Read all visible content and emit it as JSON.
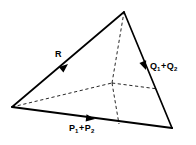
{
  "figure": {
    "name": "tetrahedron-force-diagram",
    "background_color": "#ffffff",
    "line_color": "#000000",
    "width": 196,
    "height": 145,
    "labels": {
      "resultant": {
        "text": "R",
        "base": "R",
        "sub1": "",
        "plus": "",
        "base2": "",
        "sub2": ""
      },
      "right_edge": {
        "text": "Q1 + Q2",
        "base": "Q",
        "sub1": "1",
        "plus": "+",
        "base2": "Q",
        "sub2": "2"
      },
      "bottom_edge": {
        "text": "P1 + P2",
        "base": "P",
        "sub1": "1",
        "plus": "+",
        "base2": "P",
        "sub2": "2"
      }
    },
    "vertices": {
      "apex": {
        "x": 124,
        "y": 12
      },
      "left": {
        "x": 12,
        "y": 107
      },
      "bottom_right": {
        "x": 172,
        "y": 128
      },
      "rear_hidden": {
        "x": 112,
        "y": 83
      }
    },
    "edge_points": {
      "right_edge_mid": {
        "x": 158,
        "y": 89
      },
      "bottom_edge_mid": {
        "x": 119,
        "y": 124
      }
    },
    "arrowheads": {
      "resultant": {
        "x": 68,
        "y": 64,
        "angle_deg": -40
      },
      "right_edge": {
        "x": 146,
        "y": 70,
        "angle_deg": 69
      },
      "bottom_edge": {
        "x": 95,
        "y": 119,
        "angle_deg": 7
      }
    }
  }
}
